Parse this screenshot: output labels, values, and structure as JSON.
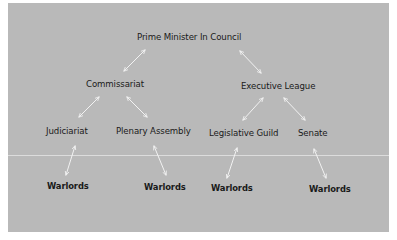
{
  "diagram": {
    "background_color": "#b9b9b9",
    "arrow_color": "#f2f2f2",
    "nodes": {
      "prime_minister": "Prime Minister In Council",
      "commissariat": "Commissariat",
      "executive_league": "Executive League",
      "judiciariat": "Judiciariat",
      "plenary_assembly": "Plenary Assembly",
      "legislative_guild": "Legislative Guild",
      "senate": "Senate",
      "warlords_1": "Warlords",
      "warlords_2": "Warlords",
      "warlords_3": "Warlords",
      "warlords_4": "Warlords"
    },
    "edges": [
      {
        "from": "Prime Minister In Council",
        "to": "Commissariat",
        "type": "bidirectional"
      },
      {
        "from": "Prime Minister In Council",
        "to": "Executive League",
        "type": "bidirectional"
      },
      {
        "from": "Commissariat",
        "to": "Judiciariat",
        "type": "bidirectional"
      },
      {
        "from": "Commissariat",
        "to": "Plenary Assembly",
        "type": "bidirectional"
      },
      {
        "from": "Executive League",
        "to": "Legislative Guild",
        "type": "bidirectional"
      },
      {
        "from": "Executive League",
        "to": "Senate",
        "type": "bidirectional"
      },
      {
        "from": "Judiciariat",
        "to": "Warlords",
        "type": "bidirectional"
      },
      {
        "from": "Plenary Assembly",
        "to": "Warlords",
        "type": "bidirectional"
      },
      {
        "from": "Legislative Guild",
        "to": "Warlords",
        "type": "bidirectional"
      },
      {
        "from": "Senate",
        "to": "Warlords",
        "type": "bidirectional"
      }
    ]
  }
}
